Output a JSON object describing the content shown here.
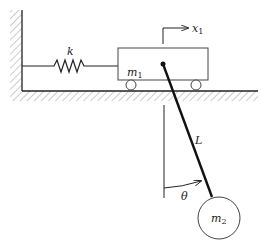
{
  "diagram": {
    "type": "mechanical-system",
    "labels": {
      "spring": "k",
      "cart_mass": "m",
      "cart_mass_sub": "1",
      "displacement": "x",
      "displacement_sub": "1",
      "pendulum_length": "L",
      "angle": "θ",
      "bob_mass": "m",
      "bob_mass_sub": "2"
    },
    "colors": {
      "line": "#222222",
      "hatch": "#888888",
      "background": "#ffffff"
    }
  }
}
